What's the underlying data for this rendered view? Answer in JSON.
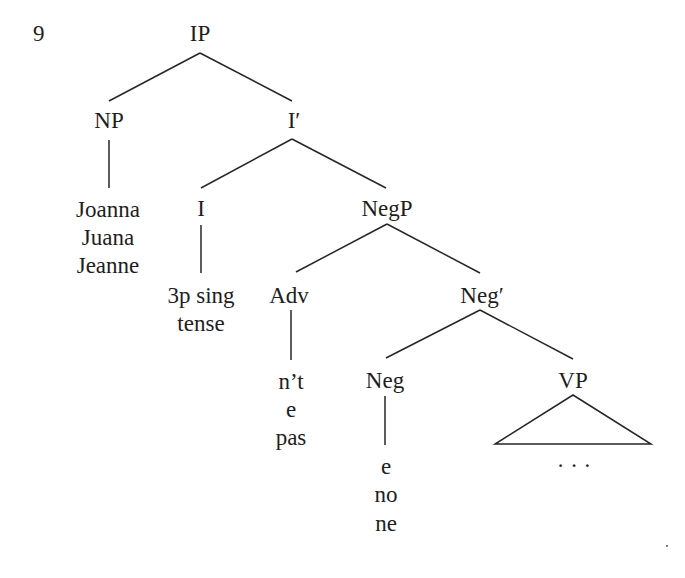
{
  "example_number": "9",
  "tree": {
    "nodes": {
      "IP": "IP",
      "NP": "NP",
      "I_bar": "I′",
      "I": "I",
      "NegP": "NegP",
      "Adv": "Adv",
      "Neg_bar": "Neg′",
      "Neg": "Neg",
      "VP": "VP"
    },
    "leaves": {
      "NP": [
        "Joanna",
        "Juana",
        "Jeanne"
      ],
      "I": [
        "3p sing",
        "tense"
      ],
      "Adv": [
        "n’t",
        "e",
        "pas"
      ],
      "Neg": [
        "e",
        "no",
        "ne"
      ],
      "VP": "· · ·"
    },
    "edges": [
      [
        "IP",
        "NP"
      ],
      [
        "IP",
        "I′"
      ],
      [
        "NP",
        "Joanna/Juana/Jeanne"
      ],
      [
        "I′",
        "I"
      ],
      [
        "I′",
        "NegP"
      ],
      [
        "I",
        "3p sing tense"
      ],
      [
        "NegP",
        "Adv"
      ],
      [
        "NegP",
        "Neg′"
      ],
      [
        "Adv",
        "n’t / e / pas"
      ],
      [
        "Neg′",
        "Neg"
      ],
      [
        "Neg′",
        "VP"
      ],
      [
        "Neg",
        "e / no / ne"
      ],
      [
        "VP",
        "triangle (...)"
      ]
    ]
  }
}
